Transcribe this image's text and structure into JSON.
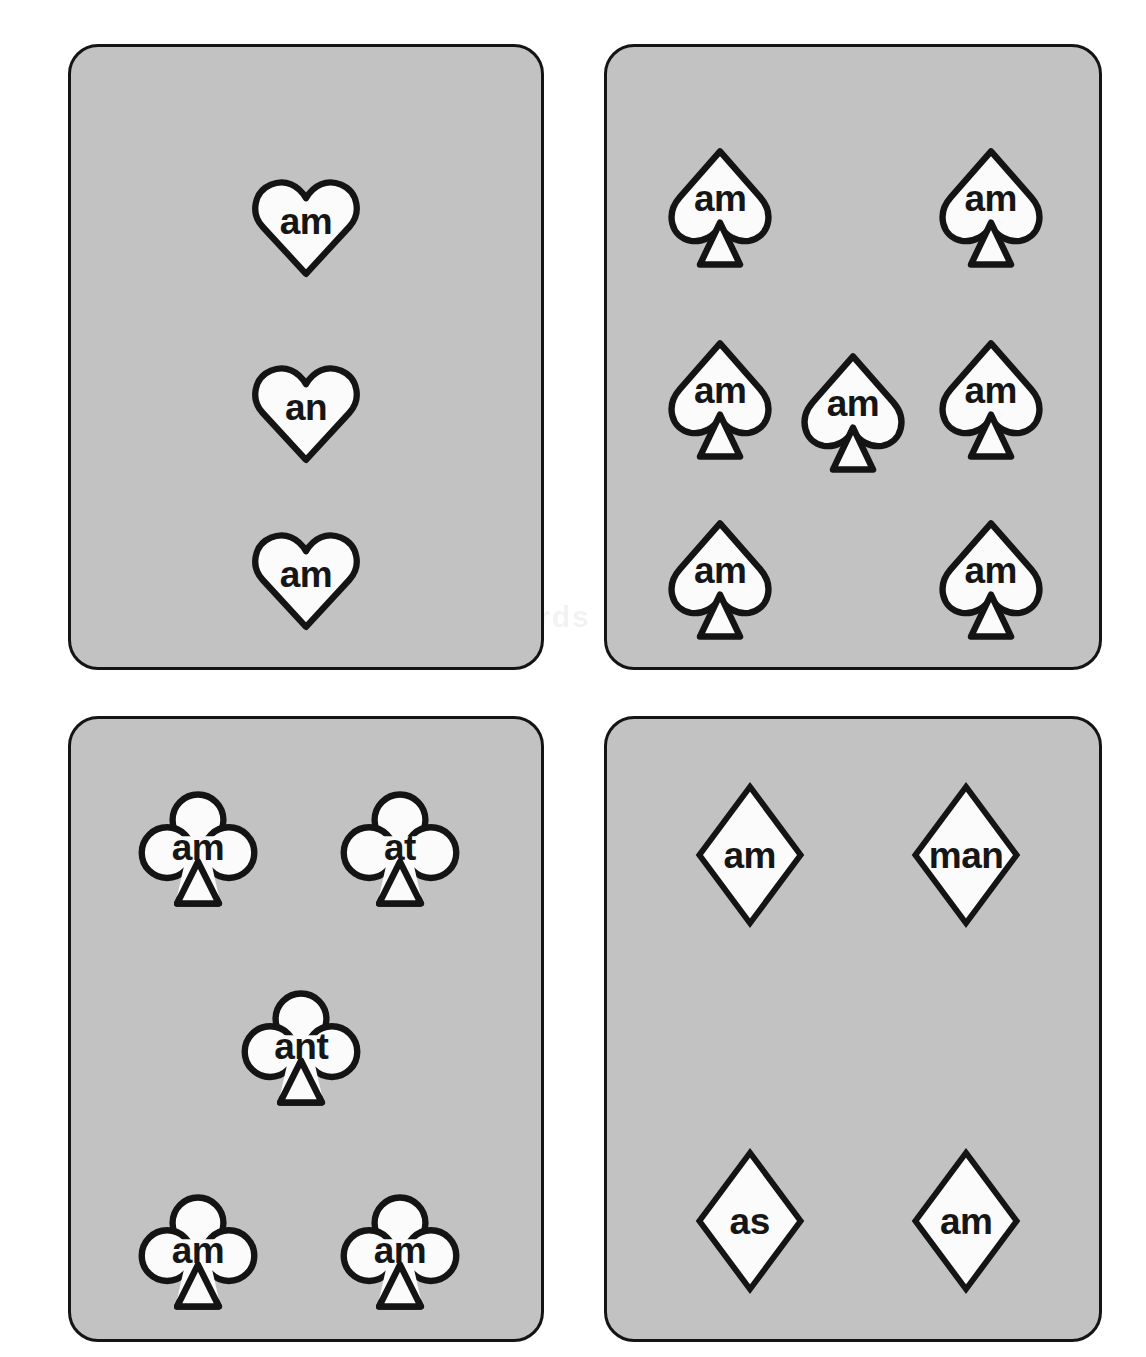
{
  "page": {
    "background_color": "#ffffff",
    "card_fill_color": "#c2c2c2",
    "card_border_color": "#141414",
    "pip_fill_color": "#fbfbfb",
    "text_color": "#161616",
    "watermark_top": "Word",
    "watermark_bottom": "sight words cards"
  },
  "cards": [
    {
      "id": "hearts",
      "suit": "heart",
      "suit_icon": "heart-icon",
      "pip_count": 3,
      "pips": [
        {
          "label": "am",
          "x": 50,
          "y": 29
        },
        {
          "label": "an",
          "x": 50,
          "y": 59
        },
        {
          "label": "am",
          "x": 50,
          "y": 86
        }
      ]
    },
    {
      "id": "spades",
      "suit": "spade",
      "suit_icon": "spade-icon",
      "pip_count": 7,
      "pips": [
        {
          "label": "am",
          "x": 23,
          "y": 26
        },
        {
          "label": "am",
          "x": 78,
          "y": 26
        },
        {
          "label": "am",
          "x": 23,
          "y": 57
        },
        {
          "label": "am",
          "x": 50,
          "y": 59
        },
        {
          "label": "am",
          "x": 78,
          "y": 57
        },
        {
          "label": "am",
          "x": 23,
          "y": 86
        },
        {
          "label": "am",
          "x": 78,
          "y": 86
        }
      ]
    },
    {
      "id": "clubs",
      "suit": "club",
      "suit_icon": "club-icon",
      "pip_count": 5,
      "pips": [
        {
          "label": "am",
          "x": 27,
          "y": 21
        },
        {
          "label": "at",
          "x": 70,
          "y": 21
        },
        {
          "label": "ant",
          "x": 49,
          "y": 53
        },
        {
          "label": "am",
          "x": 27,
          "y": 86
        },
        {
          "label": "am",
          "x": 70,
          "y": 86
        }
      ]
    },
    {
      "id": "diamonds",
      "suit": "diamond",
      "suit_icon": "diamond-icon",
      "pip_count": 4,
      "pips": [
        {
          "label": "am",
          "x": 29,
          "y": 22
        },
        {
          "label": "man",
          "x": 73,
          "y": 22
        },
        {
          "label": "as",
          "x": 29,
          "y": 81
        },
        {
          "label": "am",
          "x": 73,
          "y": 81
        }
      ]
    }
  ]
}
